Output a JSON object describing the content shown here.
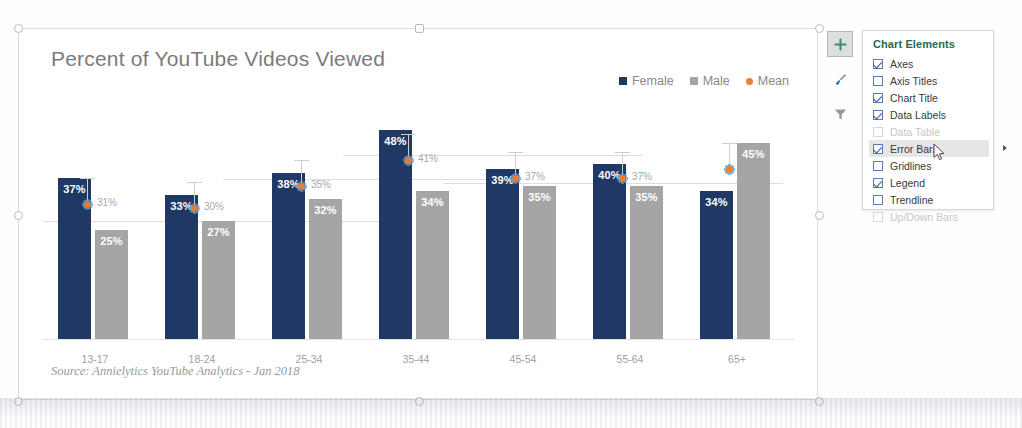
{
  "chart_data": {
    "type": "bar",
    "title": "Percent of YouTube Videos Viewed",
    "xlabel": "",
    "ylabel": "",
    "ylim": [
      0,
      50
    ],
    "grid": false,
    "legend_position": "top-right",
    "categories": [
      "13-17",
      "18-24",
      "25-34",
      "35-44",
      "45-54",
      "55-64",
      "65+"
    ],
    "series": [
      {
        "name": "Female",
        "color": "#1F3864",
        "values": [
          37,
          33,
          38,
          48,
          39,
          40,
          34
        ],
        "labels": [
          "37%",
          "33%",
          "38%",
          "48%",
          "39%",
          "40%",
          "34%"
        ]
      },
      {
        "name": "Male",
        "color": "#A5A5A5",
        "values": [
          25,
          27,
          32,
          34,
          35,
          35,
          45
        ],
        "labels": [
          "25%",
          "27%",
          "32%",
          "34%",
          "35%",
          "35%",
          "45%"
        ]
      },
      {
        "name": "Mean",
        "color": "#ED7D31",
        "values": [
          31,
          30,
          35,
          41,
          37,
          37,
          39
        ],
        "labels": [
          "31%",
          "30%",
          "35%",
          "41%",
          "37%",
          "37%",
          ""
        ]
      }
    ],
    "annotations": {
      "source_note": "Source: Annielytics YouTube Analytics - Jan 2018"
    }
  },
  "legend": {
    "items": [
      {
        "label": "Female",
        "marker": "square",
        "color": "#1F3864"
      },
      {
        "label": "Male",
        "marker": "square",
        "color": "#A5A5A5"
      },
      {
        "label": "Mean",
        "marker": "dot",
        "color": "#ED7D31"
      }
    ]
  },
  "chart_buttons": [
    {
      "icon": "plus-icon",
      "name": "chart-elements-button",
      "active": true
    },
    {
      "icon": "paintbrush-icon",
      "name": "chart-styles-button",
      "active": false
    },
    {
      "icon": "funnel-icon",
      "name": "chart-filters-button",
      "active": false
    }
  ],
  "chart_elements_panel": {
    "title": "Chart Elements",
    "items": [
      {
        "label": "Axes",
        "checked": true,
        "disabled": false,
        "hover": false,
        "submenu": false
      },
      {
        "label": "Axis Titles",
        "checked": false,
        "disabled": false,
        "hover": false,
        "submenu": false
      },
      {
        "label": "Chart Title",
        "checked": true,
        "disabled": false,
        "hover": false,
        "submenu": false
      },
      {
        "label": "Data Labels",
        "checked": true,
        "disabled": false,
        "hover": false,
        "submenu": false
      },
      {
        "label": "Data Table",
        "checked": false,
        "disabled": true,
        "hover": false,
        "submenu": false
      },
      {
        "label": "Error Bars",
        "checked": true,
        "disabled": false,
        "hover": true,
        "submenu": true
      },
      {
        "label": "Gridlines",
        "checked": false,
        "disabled": false,
        "hover": false,
        "submenu": false
      },
      {
        "label": "Legend",
        "checked": true,
        "disabled": false,
        "hover": false,
        "submenu": false
      },
      {
        "label": "Trendline",
        "checked": false,
        "disabled": false,
        "hover": false,
        "submenu": false
      },
      {
        "label": "Up/Down Bars",
        "checked": false,
        "disabled": true,
        "hover": false,
        "submenu": false
      }
    ]
  },
  "colors": {
    "female": "#1F3864",
    "male": "#A5A5A5",
    "mean": "#ED7D31",
    "title_text": "#7B7B7B",
    "panel_title": "#1F6B4E",
    "selection": "#5B9BD5"
  }
}
